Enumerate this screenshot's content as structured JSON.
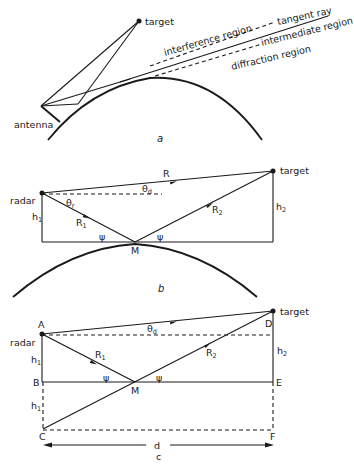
{
  "panel_a": {
    "caption": "a",
    "labels": {
      "target": "target",
      "antenna": "antenna",
      "interference": "interference region",
      "tangent": "tangent ray",
      "intermediate": "intermediate region",
      "diffraction": "diffraction region"
    }
  },
  "panel_b": {
    "caption": "b",
    "labels": {
      "radar": "radar",
      "target": "target",
      "R": "R",
      "theta_d": "θ",
      "theta_d_sub": "d",
      "theta_r": "θ",
      "theta_r_sub": "r",
      "R1": "R",
      "R1_sub": "1",
      "R2": "R",
      "R2_sub": "2",
      "h1": "h",
      "h1_sub": "1",
      "h2": "h",
      "h2_sub": "2",
      "psi_left": "ψ",
      "psi_right": "ψ",
      "M": "M"
    }
  },
  "panel_c": {
    "caption": "c",
    "labels": {
      "A": "A",
      "B": "B",
      "C": "C",
      "D": "D",
      "E": "E",
      "F": "F",
      "M": "M",
      "radar": "radar",
      "target": "target",
      "theta_d": "θ",
      "theta_d_sub": "d",
      "R1": "R",
      "R1_sub": "1",
      "R2": "R",
      "R2_sub": "2",
      "h1_top": "h",
      "h1_top_sub": "1",
      "h1_bottom": "h",
      "h1_bottom_sub": "1",
      "h2": "h",
      "h2_sub": "2",
      "psi_left": "ψ",
      "psi_right": "ψ",
      "d": "d"
    }
  }
}
